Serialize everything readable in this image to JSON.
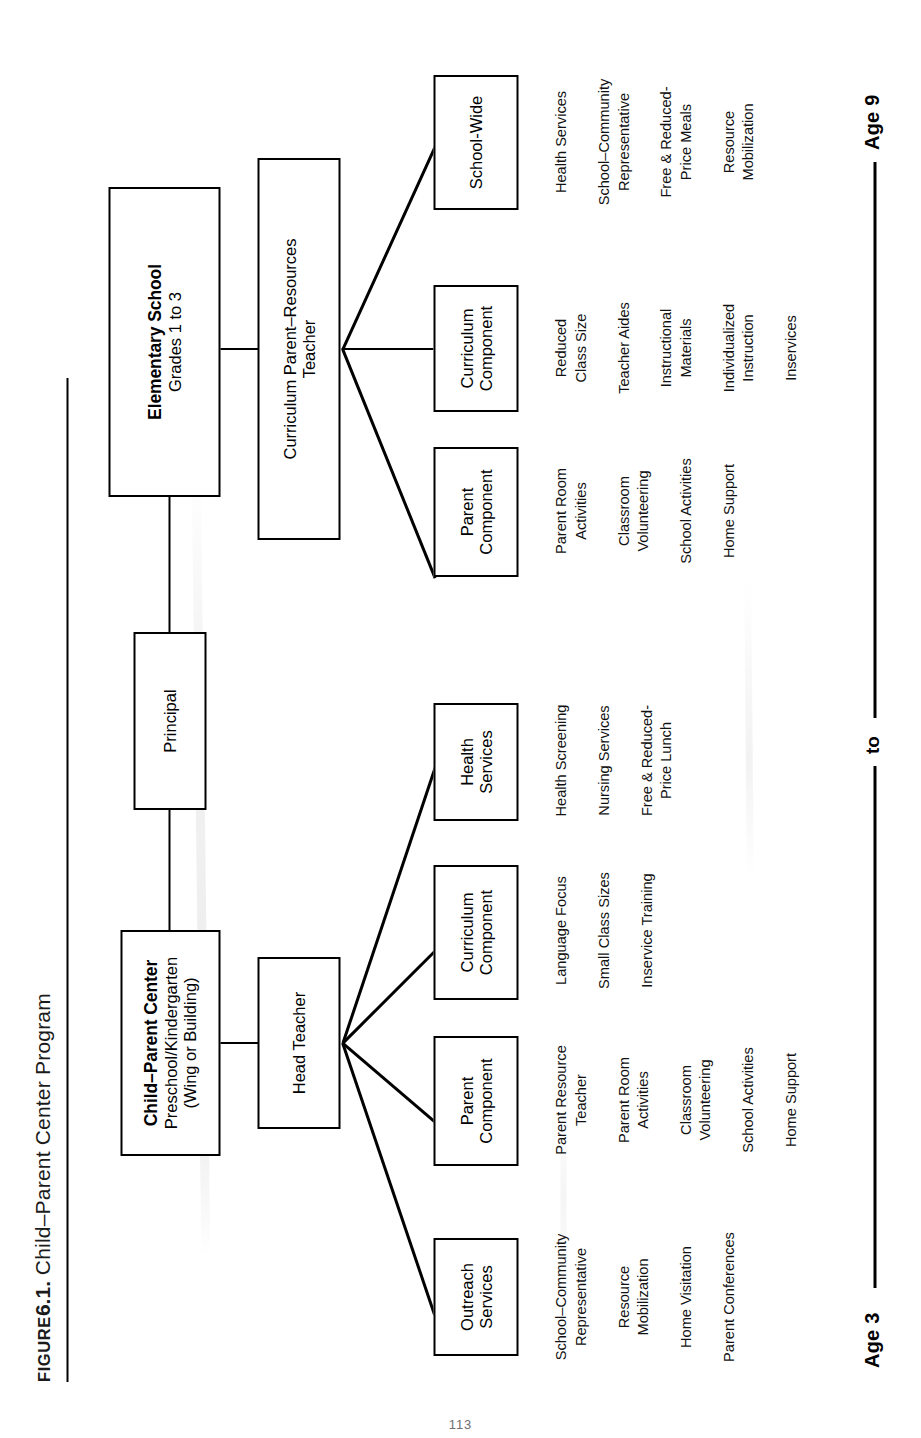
{
  "caption": {
    "figure_label": "Figure",
    "figure_number": "6.1.",
    "text": "Child–Parent Center Program"
  },
  "nodes": {
    "cpc": {
      "title": "Child–Parent Center",
      "sub1": "Preschool/Kindergarten",
      "sub2": "(Wing or Building)"
    },
    "elementary": {
      "title": "Elementary School",
      "sub1": "Grades 1 to 3"
    },
    "principal": {
      "title": "Principal"
    },
    "head_teacher": {
      "title": "Head Teacher"
    },
    "crt": {
      "line1": "Curriculum Parent–Resources",
      "line2": "Teacher"
    }
  },
  "cpc_branches": [
    {
      "name": "outreach-services",
      "title_line1": "Outreach",
      "title_line2": "Services",
      "details": [
        "School–Community\nRepresentative",
        "Resource\nMobilization",
        "Home Visitation",
        "Parent Conferences"
      ]
    },
    {
      "name": "parent-component-cpc",
      "title_line1": "Parent",
      "title_line2": "Component",
      "details": [
        "Parent Resource\nTeacher",
        "Parent Room\nActivities",
        "Classroom\nVolunteering",
        "School Activities",
        "Home Support"
      ]
    },
    {
      "name": "curriculum-component-cpc",
      "title_line1": "Curriculum",
      "title_line2": "Component",
      "details": [
        "Language Focus",
        "Small Class Sizes",
        "Inservice Training"
      ]
    },
    {
      "name": "health-services",
      "title_line1": "Health",
      "title_line2": "Services",
      "details": [
        "Health Screening",
        "Nursing Services",
        "Free & Reduced-\nPrice Lunch"
      ]
    }
  ],
  "elementary_branches": [
    {
      "name": "parent-component-elementary",
      "title_line1": "Parent",
      "title_line2": "Component",
      "details": [
        "Parent Room\nActivities",
        "Classroom\nVolunteering",
        "School Activities",
        "Home Support"
      ]
    },
    {
      "name": "curriculum-component-elementary",
      "title_line1": "Curriculum",
      "title_line2": "Component",
      "details": [
        "Reduced\nClass Size",
        "Teacher Aides",
        "Instructional\nMaterials",
        "Individualized\nInstruction",
        "Inservices"
      ]
    },
    {
      "name": "school-wide",
      "title_line1": "School-Wide",
      "title_line2": "",
      "details": [
        "Health Services",
        "School–Community\nRepresentative",
        "Free & Reduced-\nPrice Meals",
        "Resource\nMobilization"
      ]
    }
  ],
  "timeline": {
    "start_label": "Age 3",
    "mid_label": "to",
    "end_label": "Age 9"
  },
  "colors": {
    "ink": "#000000",
    "paper": "#ffffff",
    "caption_ink": "#1b1b1b"
  },
  "folio": "113"
}
